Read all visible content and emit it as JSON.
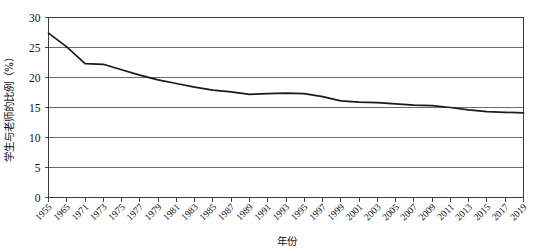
{
  "chart_data": {
    "type": "line",
    "title": "",
    "xlabel": "年份",
    "ylabel": "学生与老师的比例（%）",
    "ylim": [
      0,
      30
    ],
    "yticks": [
      0,
      5,
      10,
      15,
      20,
      25,
      30
    ],
    "ytick_labels": [
      "0",
      "5",
      "10",
      "15",
      "20",
      "25",
      "30"
    ],
    "grid": true,
    "legend": false,
    "line_color": "#1a1a1a",
    "x": [
      1955,
      1965,
      1971,
      1973,
      1975,
      1977,
      1979,
      1981,
      1983,
      1985,
      1987,
      1989,
      1991,
      1993,
      1995,
      1997,
      1999,
      2001,
      2003,
      2005,
      2007,
      2009,
      2011,
      2013,
      2015,
      2017,
      2019
    ],
    "xtick_labels": [
      "1955",
      "1965",
      "1971",
      "1973",
      "1975",
      "1977",
      "1979",
      "1981",
      "1983",
      "1985",
      "1987",
      "1989",
      "1991",
      "1993",
      "1995",
      "1997",
      "1999",
      "2001",
      "2003",
      "2005",
      "2007",
      "2009",
      "2011",
      "2013",
      "2015",
      "2017",
      "2019"
    ],
    "series": [
      {
        "name": "学生与老师的比例",
        "values": [
          27.4,
          25.1,
          22.3,
          22.2,
          21.3,
          20.4,
          19.6,
          19.0,
          18.4,
          17.9,
          17.6,
          17.2,
          17.3,
          17.4,
          17.3,
          16.8,
          16.1,
          15.9,
          15.8,
          15.6,
          15.4,
          15.3,
          15.0,
          14.6,
          14.3,
          14.2,
          14.1
        ]
      }
    ]
  },
  "axis": {
    "y_label": "学生与老师的比例（%）",
    "x_label": "年份"
  }
}
